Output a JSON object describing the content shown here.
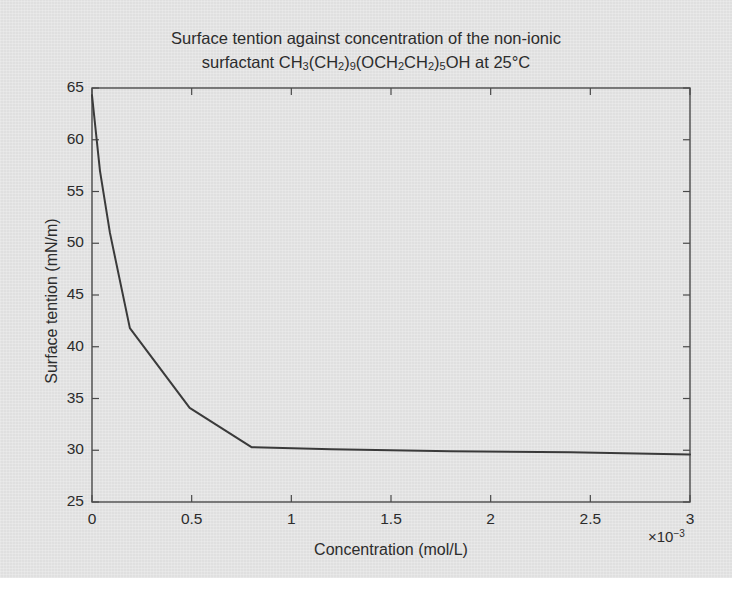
{
  "figure": {
    "title_line1": "Surface tention against concentration of the non-ionic",
    "title_line2_prefix": "surfactant CH",
    "title_line2_suffix": "OH at 25°C",
    "ylabel": "Surface tention (mN/m)",
    "xlabel": "Concentration (mol/L)",
    "exponent_label": "×10",
    "exponent_power": "−3",
    "line_color": "#3a3a3a",
    "axis_color": "#4a4a4a",
    "text_color": "#2c2c2c",
    "background_color": "#e4e4e4"
  },
  "chart_data": {
    "type": "line",
    "title": "Surface tention against concentration of the non-ionic surfactant CH3(CH2)9(OCH2CH2)5OH at 25°C",
    "xlabel": "Concentration (mol/L)",
    "ylabel": "Surface tention (mN/m)",
    "x_scale_factor": "1e-3",
    "xlim": [
      0,
      3
    ],
    "ylim": [
      25,
      65
    ],
    "xticks": [
      "0",
      "0.5",
      "1",
      "1.5",
      "2",
      "2.5",
      "3"
    ],
    "xtick_values": [
      0,
      0.5,
      1,
      1.5,
      2,
      2.5,
      3
    ],
    "yticks": [
      "25",
      "30",
      "35",
      "40",
      "45",
      "50",
      "55",
      "60",
      "65"
    ],
    "ytick_values": [
      25,
      30,
      35,
      40,
      45,
      50,
      55,
      60,
      65
    ],
    "grid": false,
    "legend": null,
    "series": [
      {
        "name": "Surface tention",
        "x": [
          0.0,
          0.04,
          0.09,
          0.19,
          0.49,
          0.8,
          1.2,
          1.8,
          2.4,
          3.0
        ],
        "y": [
          64.3,
          57.0,
          51.0,
          41.8,
          34.1,
          30.3,
          30.1,
          29.9,
          29.8,
          29.6
        ]
      }
    ],
    "annotations": [
      "Curve shows steep decrease to a critical micelle concentration elbow near 0.8×10⁻³ mol/L, then a flat plateau near 30 mN/m."
    ]
  }
}
